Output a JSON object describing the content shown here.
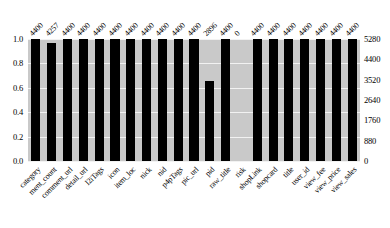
{
  "chart_data": {
    "type": "bar",
    "title": "",
    "subtitle": "",
    "xlabel": "",
    "ylabel": "",
    "y2label": "",
    "grid": true,
    "legend": "none",
    "categories": [
      "category",
      "ment_count",
      "comment_url",
      "detail_url",
      "l2iTags",
      "icon",
      "item_loc",
      "nick",
      "nid",
      "p4pTags",
      "pic_url",
      "pid",
      "raw_title",
      "risk",
      "shopLink",
      "shopcard",
      "title",
      "user_id",
      "view_fee",
      "view_price",
      "view_sales"
    ],
    "values": [
      1.0,
      0.9675,
      1.0,
      1.0,
      1.0,
      1.0,
      1.0,
      1.0,
      1.0,
      1.0,
      1.0,
      0.6582,
      1.0,
      0.0,
      1.0,
      1.0,
      1.0,
      1.0,
      1.0,
      1.0,
      1.0
    ],
    "counts": [
      "4400",
      "4257",
      "4400",
      "4400",
      "4400",
      "4400",
      "4400",
      "4400",
      "4400",
      "4400",
      "4400",
      "2896",
      "4400",
      "0",
      "4400",
      "4400",
      "4400",
      "4400",
      "4400",
      "4400",
      "4400"
    ],
    "ylim": [
      0,
      1.0
    ],
    "yticks": [
      "1.0",
      "0.8",
      "0.6",
      "0.4",
      "0.2",
      "0.0"
    ],
    "ytick_values": [
      1.0,
      0.8,
      0.6,
      0.4,
      0.2,
      0.0
    ],
    "y2lim": [
      0,
      5280
    ],
    "y2ticks": [
      "5280",
      "4400",
      "3520",
      "2640",
      "1760",
      "880",
      "0"
    ],
    "y2tick_values": [
      5280,
      4400,
      3520,
      2640,
      1760,
      880,
      0
    ],
    "colors": {
      "bar": "#000000",
      "plot_background": "#c9c9c9",
      "gridline": "#f2f2f2",
      "figure_background": "#ffffff",
      "text": "#000000"
    }
  }
}
